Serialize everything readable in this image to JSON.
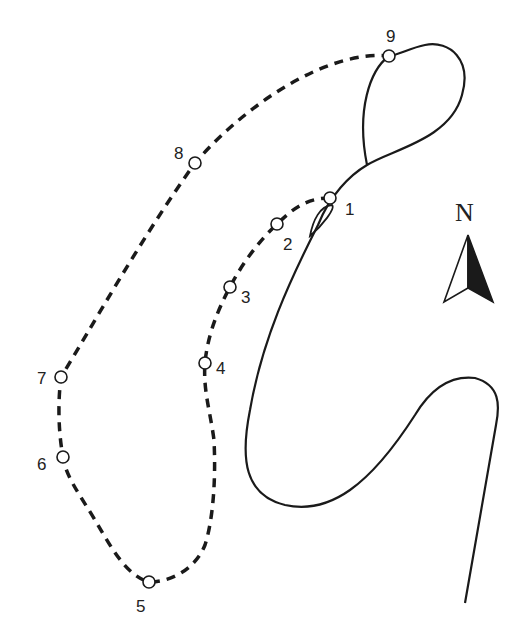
{
  "diagram": {
    "type": "route-map",
    "colors": {
      "line": "#1a1a1a",
      "background": "#ffffff",
      "marker_fill": "#ffffff"
    },
    "waypoints": [
      {
        "label": "1",
        "x": 330,
        "y": 198,
        "lx": 345,
        "ly": 215
      },
      {
        "label": "2",
        "x": 277,
        "y": 224,
        "lx": 283,
        "ly": 250
      },
      {
        "label": "3",
        "x": 230,
        "y": 287,
        "lx": 241,
        "ly": 303
      },
      {
        "label": "4",
        "x": 205,
        "y": 363,
        "lx": 216,
        "ly": 374
      },
      {
        "label": "5",
        "x": 149,
        "y": 582,
        "lx": 136,
        "ly": 612
      },
      {
        "label": "6",
        "x": 63,
        "y": 457,
        "lx": 37,
        "ly": 470
      },
      {
        "label": "7",
        "x": 61,
        "y": 377,
        "lx": 37,
        "ly": 384
      },
      {
        "label": "8",
        "x": 195,
        "y": 163,
        "lx": 174,
        "ly": 159
      },
      {
        "label": "9",
        "x": 389,
        "y": 56,
        "lx": 386,
        "ly": 42
      }
    ],
    "north_arrow": {
      "label": "N"
    }
  }
}
